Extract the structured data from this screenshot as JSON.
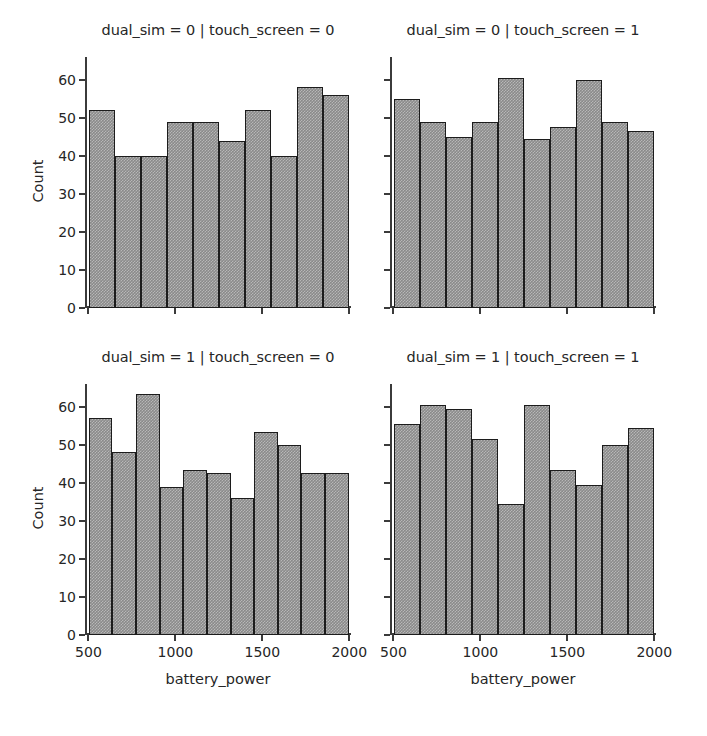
{
  "figure": {
    "width": 707,
    "height": 736,
    "background": "#ffffff",
    "bar_fill_color": "#8a8a8a",
    "bar_edge_color": "#1c1c1c",
    "axis_color": "#3b3b3b",
    "text_color": "#262626"
  },
  "chart_data": {
    "type": "bar",
    "title": "",
    "xlabel": "battery_power",
    "ylabel": "Count",
    "xlim": [
      480,
      2010
    ],
    "ylim": [
      0,
      66
    ],
    "grid": false,
    "legend": null,
    "xticks": [
      500,
      1000,
      1500,
      2000
    ],
    "xtick_labels": [
      "500",
      "1000",
      "1500",
      "2000"
    ],
    "yticks": [
      0,
      10,
      20,
      30,
      40,
      50,
      60
    ],
    "ytick_labels": [
      "0",
      "10",
      "20",
      "30",
      "40",
      "50",
      "60"
    ],
    "facets": [
      {
        "id": "facet-0-0",
        "title": "dual_sim = 0 | touch_screen = 0",
        "dual_sim": 0,
        "touch_screen": 0,
        "row": 0,
        "col": 0,
        "ylabel": "Count",
        "xlabel": "",
        "bin_edges": [
          501,
          651,
          801,
          951,
          1101,
          1251,
          1401,
          1551,
          1701,
          1851,
          1998
        ],
        "values": [
          52,
          40,
          40,
          49,
          49,
          44,
          52,
          40,
          58,
          56
        ]
      },
      {
        "id": "facet-0-1",
        "title": "dual_sim = 0 | touch_screen = 1",
        "dual_sim": 0,
        "touch_screen": 1,
        "row": 0,
        "col": 1,
        "ylabel": "",
        "xlabel": "",
        "bin_edges": [
          501,
          651,
          801,
          951,
          1101,
          1251,
          1401,
          1551,
          1701,
          1851,
          1998
        ],
        "values": [
          55,
          49,
          45,
          49,
          60.5,
          44.5,
          47.5,
          60,
          49,
          46.5
        ]
      },
      {
        "id": "facet-1-0",
        "title": "dual_sim = 1 | touch_screen = 0",
        "dual_sim": 1,
        "touch_screen": 0,
        "row": 1,
        "col": 0,
        "ylabel": "Count",
        "xlabel": "battery_power",
        "bin_edges": [
          501,
          637,
          773,
          909,
          1045,
          1181,
          1317,
          1453,
          1589,
          1725,
          1861,
          1998
        ],
        "values": [
          57,
          48,
          63.5,
          39,
          43.5,
          42.5,
          36,
          53.5,
          50,
          42.5,
          42.5
        ]
      },
      {
        "id": "facet-1-1",
        "title": "dual_sim = 1 | touch_screen = 1",
        "dual_sim": 1,
        "touch_screen": 1,
        "row": 1,
        "col": 1,
        "ylabel": "",
        "xlabel": "battery_power",
        "bin_edges": [
          501,
          651,
          801,
          951,
          1101,
          1251,
          1401,
          1551,
          1701,
          1851,
          1998
        ],
        "values": [
          55.5,
          60.5,
          59.5,
          51.5,
          34.5,
          60.5,
          43.5,
          39.5,
          50,
          54.5
        ]
      }
    ]
  }
}
